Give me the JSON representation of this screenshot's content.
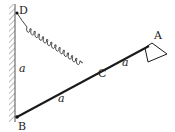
{
  "diagram": {
    "labels": {
      "D": "D",
      "B": "B",
      "C": "C",
      "A": "A",
      "wall_length": "a",
      "rod_BC": "a",
      "rod_CA": "a"
    },
    "line_color": "#1a1a1a",
    "wall_hatch_color": "#777777"
  }
}
